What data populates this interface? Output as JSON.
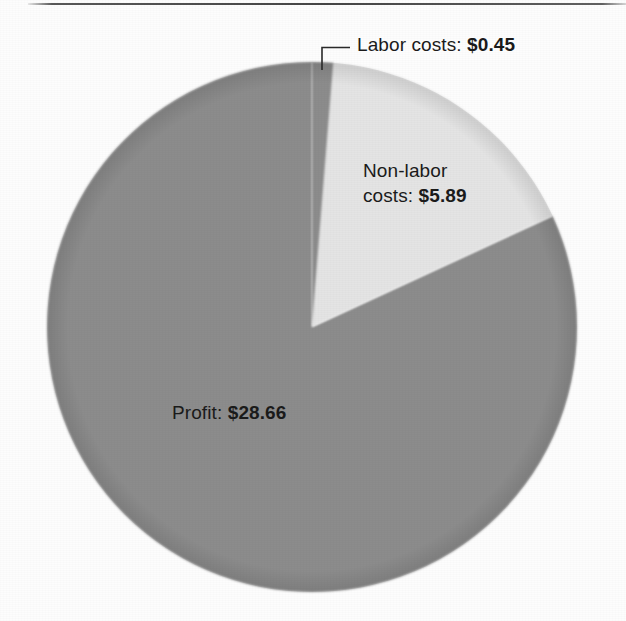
{
  "figure": {
    "background_color": "#fdfdfd",
    "text_color": "#1b1b1b",
    "top_rule_color": "#3c3c3c"
  },
  "chart_data": {
    "type": "pie",
    "title": "",
    "subtitle": "",
    "xlabel": "",
    "ylabel": "",
    "legend_position": "none",
    "grid": false,
    "currency": "$",
    "total": 35.0,
    "categories": [
      "Labor costs",
      "Non-labor costs",
      "Profit"
    ],
    "values": [
      0.45,
      5.89,
      28.66
    ],
    "value_labels": [
      "$0.45",
      "$5.89",
      "$28.66"
    ],
    "percentages": [
      1.29,
      16.83,
      81.89
    ],
    "start_angle_deg": 0,
    "direction": "clockwise",
    "slices": [
      {
        "name": "Labor costs",
        "value": 0.45,
        "value_label": "$0.45",
        "percent": 1.29,
        "color": "#8c8c8c",
        "angle_deg": 4.63,
        "label_text": "Labor costs: ",
        "label_amount": "$0.45",
        "label_placement": "outside-leader"
      },
      {
        "name": "Non-labor costs",
        "value": 5.89,
        "value_label": "$5.89",
        "percent": 16.83,
        "color": "#e4e4e4",
        "angle_deg": 60.6,
        "label_line1": "Non-labor",
        "label_line2_text": "costs: ",
        "label_amount": "$5.89",
        "label_placement": "inside"
      },
      {
        "name": "Profit",
        "value": 28.66,
        "value_label": "$28.66",
        "percent": 81.89,
        "color": "#8c8c8c",
        "angle_deg": 294.77,
        "label_text": "Profit: ",
        "label_amount": "$28.66",
        "label_placement": "inside"
      }
    ]
  },
  "geometry": {
    "center_x": 312,
    "center_y": 327,
    "radius": 265
  }
}
